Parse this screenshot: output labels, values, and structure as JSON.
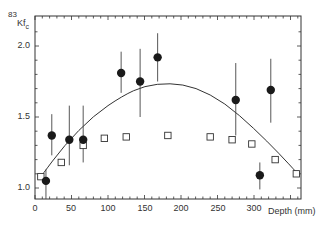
{
  "chart_data": {
    "type": "scatter",
    "title": "",
    "figure_label": "83",
    "ylabel": "Kf_c",
    "xlabel": "Depth (mm)",
    "xlim": [
      0,
      365
    ],
    "ylim": [
      0.92,
      2.21
    ],
    "x_ticks": [
      0,
      50,
      100,
      150,
      200,
      250,
      300
    ],
    "y_ticks": [
      1.0,
      1.5,
      2.0
    ],
    "grid": false,
    "legend": null,
    "series": [
      {
        "name": "measured (filled circles, with error bars)",
        "marker": "filled-circle",
        "points": [
          {
            "x": 15,
            "y": 1.05,
            "lo": 0.88,
            "hi": 1.13
          },
          {
            "x": 23,
            "y": 1.37,
            "lo": 1.23,
            "hi": 1.52
          },
          {
            "x": 47,
            "y": 1.34,
            "lo": 1.16,
            "hi": 1.58
          },
          {
            "x": 66,
            "y": 1.34,
            "lo": 1.18,
            "hi": 1.58
          },
          {
            "x": 118,
            "y": 1.81,
            "lo": 1.67,
            "hi": 1.96
          },
          {
            "x": 144,
            "y": 1.75,
            "lo": 1.5,
            "hi": 1.98
          },
          {
            "x": 168,
            "y": 1.92,
            "lo": 1.75,
            "hi": 2.09
          },
          {
            "x": 275,
            "y": 1.62,
            "lo": 1.37,
            "hi": 1.88
          },
          {
            "x": 308,
            "y": 1.09,
            "lo": 0.99,
            "hi": 1.18
          },
          {
            "x": 323,
            "y": 1.69,
            "lo": 1.46,
            "hi": 1.91
          }
        ]
      },
      {
        "name": "calculated (open squares)",
        "marker": "open-square",
        "points": [
          {
            "x": 8,
            "y": 1.08
          },
          {
            "x": 36,
            "y": 1.18
          },
          {
            "x": 66,
            "y": 1.3
          },
          {
            "x": 95,
            "y": 1.35
          },
          {
            "x": 125,
            "y": 1.36
          },
          {
            "x": 182,
            "y": 1.37
          },
          {
            "x": 240,
            "y": 1.36
          },
          {
            "x": 270,
            "y": 1.34
          },
          {
            "x": 297,
            "y": 1.31
          },
          {
            "x": 329,
            "y": 1.2
          },
          {
            "x": 358,
            "y": 1.1
          }
        ]
      },
      {
        "name": "fitted curve",
        "marker": "line",
        "points": [
          {
            "x": 8,
            "y": 1.08
          },
          {
            "x": 40,
            "y": 1.3
          },
          {
            "x": 80,
            "y": 1.51
          },
          {
            "x": 120,
            "y": 1.65
          },
          {
            "x": 150,
            "y": 1.72
          },
          {
            "x": 185,
            "y": 1.74
          },
          {
            "x": 220,
            "y": 1.71
          },
          {
            "x": 260,
            "y": 1.6
          },
          {
            "x": 300,
            "y": 1.42
          },
          {
            "x": 335,
            "y": 1.24
          },
          {
            "x": 360,
            "y": 1.1
          }
        ]
      }
    ]
  },
  "labels": {
    "figure_number": "83",
    "y_axis": "Kf",
    "y_axis_sub": "c",
    "x_axis": "Depth (mm)",
    "y_tick_1": "1.0",
    "y_tick_15": "1.5",
    "y_tick_2": "2.0",
    "x_tick_0": "0",
    "x_tick_50": "50",
    "x_tick_100": "100",
    "x_tick_150": "150",
    "x_tick_200": "200",
    "x_tick_250": "250",
    "x_tick_300": "300"
  }
}
